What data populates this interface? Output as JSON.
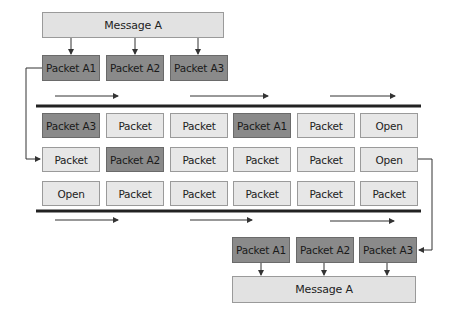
{
  "source_message": {
    "label": "Message A"
  },
  "source_packets": [
    {
      "label": "Packet A1"
    },
    {
      "label": "Packet A2"
    },
    {
      "label": "Packet A3"
    }
  ],
  "network_grid": {
    "rows": [
      [
        {
          "label": "Packet A3",
          "highlight": true
        },
        {
          "label": "Packet",
          "highlight": false
        },
        {
          "label": "Packet",
          "highlight": false
        },
        {
          "label": "Packet A1",
          "highlight": true
        },
        {
          "label": "Packet",
          "highlight": false
        },
        {
          "label": "Open",
          "highlight": false
        }
      ],
      [
        {
          "label": "Packet",
          "highlight": false
        },
        {
          "label": "Packet A2",
          "highlight": true
        },
        {
          "label": "Packet",
          "highlight": false
        },
        {
          "label": "Packet",
          "highlight": false
        },
        {
          "label": "Packet",
          "highlight": false
        },
        {
          "label": "Open",
          "highlight": false
        }
      ],
      [
        {
          "label": "Open",
          "highlight": false
        },
        {
          "label": "Packet",
          "highlight": false
        },
        {
          "label": "Packet",
          "highlight": false
        },
        {
          "label": "Packet",
          "highlight": false
        },
        {
          "label": "Packet",
          "highlight": false
        },
        {
          "label": "Packet",
          "highlight": false
        }
      ]
    ]
  },
  "dest_packets": [
    {
      "label": "Packet A1"
    },
    {
      "label": "Packet A2"
    },
    {
      "label": "Packet A3"
    }
  ],
  "dest_message": {
    "label": "Message A"
  },
  "colors": {
    "highlight": "#8a8a8a",
    "normal": "#e7e7e7",
    "line": "#333333"
  }
}
